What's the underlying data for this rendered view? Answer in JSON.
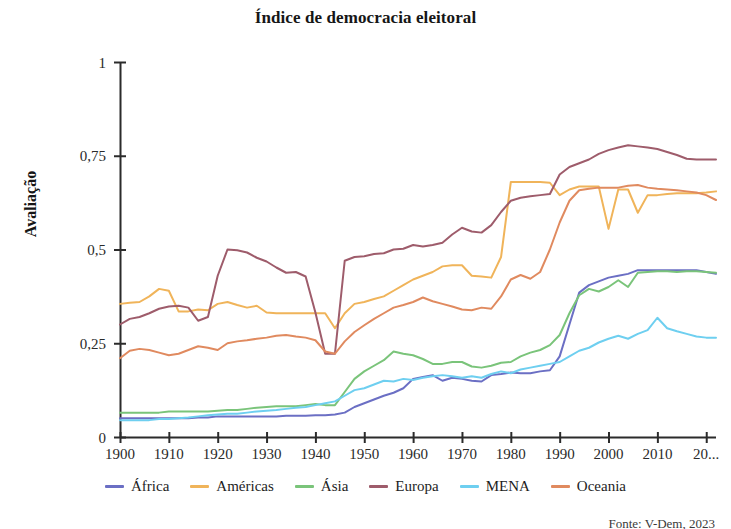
{
  "chart_data": {
    "type": "line",
    "title": "Índice de democracia eleitoral",
    "xlabel": "",
    "ylabel": "Avaliação",
    "xlim": [
      1900,
      2022
    ],
    "ylim": [
      0,
      1
    ],
    "grid": false,
    "legend_position": "bottom",
    "x_tick_labels": [
      "1900",
      "1910",
      "1920",
      "1930",
      "1940",
      "1950",
      "1960",
      "1970",
      "1980",
      "1990",
      "2000",
      "2010",
      "20..."
    ],
    "x_ticks": [
      1900,
      1910,
      1920,
      1930,
      1940,
      1950,
      1960,
      1970,
      1980,
      1990,
      2000,
      2010,
      2020
    ],
    "y_tick_labels": [
      "0",
      "0,25",
      "0,5",
      "0,75",
      "1"
    ],
    "y_ticks": [
      0,
      0.25,
      0.5,
      0.75,
      1
    ],
    "x": [
      1900,
      1902,
      1904,
      1906,
      1908,
      1910,
      1912,
      1914,
      1916,
      1918,
      1920,
      1922,
      1924,
      1926,
      1928,
      1930,
      1932,
      1934,
      1936,
      1938,
      1940,
      1942,
      1944,
      1946,
      1948,
      1950,
      1952,
      1954,
      1956,
      1958,
      1960,
      1962,
      1964,
      1966,
      1968,
      1970,
      1972,
      1974,
      1976,
      1978,
      1980,
      1982,
      1984,
      1986,
      1988,
      1990,
      1992,
      1994,
      1996,
      1998,
      2000,
      2002,
      2004,
      2006,
      2008,
      2010,
      2012,
      2014,
      2016,
      2018,
      2020,
      2022
    ],
    "series": [
      {
        "name": "África",
        "color": "#6b6fc4",
        "values": [
          0.05,
          0.05,
          0.05,
          0.05,
          0.05,
          0.05,
          0.05,
          0.05,
          0.052,
          0.052,
          0.055,
          0.055,
          0.055,
          0.055,
          0.055,
          0.055,
          0.055,
          0.057,
          0.057,
          0.057,
          0.058,
          0.058,
          0.06,
          0.065,
          0.08,
          0.09,
          0.1,
          0.11,
          0.118,
          0.13,
          0.155,
          0.16,
          0.165,
          0.15,
          0.158,
          0.155,
          0.15,
          0.148,
          0.165,
          0.168,
          0.172,
          0.17,
          0.17,
          0.175,
          0.178,
          0.215,
          0.3,
          0.385,
          0.405,
          0.415,
          0.425,
          0.43,
          0.435,
          0.445,
          0.445,
          0.445,
          0.445,
          0.445,
          0.445,
          0.445,
          0.44,
          0.435
        ]
      },
      {
        "name": "Américas",
        "color": "#f0b45a",
        "values": [
          0.355,
          0.358,
          0.36,
          0.375,
          0.395,
          0.39,
          0.335,
          0.335,
          0.34,
          0.338,
          0.355,
          0.36,
          0.352,
          0.345,
          0.35,
          0.332,
          0.33,
          0.33,
          0.33,
          0.33,
          0.33,
          0.33,
          0.29,
          0.33,
          0.355,
          0.36,
          0.368,
          0.375,
          0.39,
          0.405,
          0.42,
          0.43,
          0.44,
          0.455,
          0.458,
          0.458,
          0.43,
          0.428,
          0.425,
          0.48,
          0.68,
          0.68,
          0.68,
          0.68,
          0.678,
          0.645,
          0.66,
          0.668,
          0.668,
          0.668,
          0.555,
          0.66,
          0.66,
          0.598,
          0.645,
          0.645,
          0.648,
          0.65,
          0.65,
          0.65,
          0.652,
          0.655
        ]
      },
      {
        "name": "Ásia",
        "color": "#7ac47a",
        "values": [
          0.065,
          0.065,
          0.065,
          0.065,
          0.065,
          0.068,
          0.068,
          0.068,
          0.068,
          0.068,
          0.07,
          0.072,
          0.072,
          0.075,
          0.078,
          0.08,
          0.082,
          0.082,
          0.082,
          0.085,
          0.088,
          0.085,
          0.085,
          0.12,
          0.155,
          0.175,
          0.19,
          0.205,
          0.228,
          0.222,
          0.218,
          0.208,
          0.195,
          0.195,
          0.2,
          0.2,
          0.188,
          0.185,
          0.19,
          0.198,
          0.2,
          0.215,
          0.225,
          0.232,
          0.245,
          0.272,
          0.33,
          0.378,
          0.395,
          0.388,
          0.4,
          0.418,
          0.4,
          0.438,
          0.44,
          0.442,
          0.442,
          0.44,
          0.442,
          0.442,
          0.44,
          0.438
        ]
      },
      {
        "name": "Europa",
        "color": "#9e5c6b",
        "values": [
          0.3,
          0.315,
          0.32,
          0.33,
          0.342,
          0.348,
          0.35,
          0.345,
          0.31,
          0.32,
          0.43,
          0.5,
          0.498,
          0.492,
          0.478,
          0.468,
          0.452,
          0.438,
          0.44,
          0.428,
          0.332,
          0.222,
          0.222,
          0.47,
          0.48,
          0.482,
          0.488,
          0.49,
          0.5,
          0.502,
          0.512,
          0.508,
          0.512,
          0.518,
          0.54,
          0.558,
          0.548,
          0.545,
          0.565,
          0.6,
          0.63,
          0.638,
          0.642,
          0.645,
          0.648,
          0.7,
          0.72,
          0.73,
          0.74,
          0.755,
          0.765,
          0.772,
          0.778,
          0.775,
          0.772,
          0.768,
          0.76,
          0.752,
          0.742,
          0.74,
          0.74,
          0.74
        ]
      },
      {
        "name": "MENA",
        "color": "#6ecff0",
        "values": [
          0.045,
          0.045,
          0.045,
          0.045,
          0.048,
          0.048,
          0.05,
          0.052,
          0.055,
          0.058,
          0.06,
          0.062,
          0.062,
          0.065,
          0.068,
          0.07,
          0.072,
          0.075,
          0.078,
          0.08,
          0.085,
          0.09,
          0.095,
          0.11,
          0.125,
          0.13,
          0.14,
          0.15,
          0.148,
          0.155,
          0.152,
          0.158,
          0.162,
          0.165,
          0.162,
          0.158,
          0.162,
          0.158,
          0.168,
          0.175,
          0.17,
          0.18,
          0.185,
          0.19,
          0.195,
          0.2,
          0.215,
          0.23,
          0.238,
          0.252,
          0.262,
          0.27,
          0.262,
          0.275,
          0.285,
          0.318,
          0.29,
          0.282,
          0.275,
          0.268,
          0.265,
          0.265
        ]
      },
      {
        "name": "Oceania",
        "color": "#e08a5f",
        "values": [
          0.21,
          0.23,
          0.235,
          0.232,
          0.225,
          0.218,
          0.222,
          0.232,
          0.242,
          0.238,
          0.232,
          0.25,
          0.255,
          0.258,
          0.262,
          0.265,
          0.27,
          0.272,
          0.268,
          0.265,
          0.258,
          0.228,
          0.222,
          0.255,
          0.28,
          0.298,
          0.315,
          0.33,
          0.345,
          0.352,
          0.36,
          0.372,
          0.362,
          0.355,
          0.348,
          0.34,
          0.338,
          0.345,
          0.342,
          0.375,
          0.42,
          0.432,
          0.422,
          0.44,
          0.5,
          0.572,
          0.63,
          0.658,
          0.662,
          0.665,
          0.665,
          0.665,
          0.67,
          0.672,
          0.665,
          0.662,
          0.66,
          0.658,
          0.655,
          0.652,
          0.645,
          0.632
        ]
      }
    ]
  },
  "source": {
    "text": "Fonte: V-Dem, 2023"
  }
}
